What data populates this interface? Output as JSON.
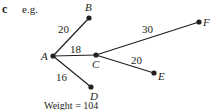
{
  "part_label": "c",
  "intro": "e.g.",
  "graph": {
    "nodes": [
      {
        "id": "A",
        "x": 53,
        "y": 56,
        "label": "A",
        "lx": 41,
        "ly": 60
      },
      {
        "id": "B",
        "x": 89,
        "y": 18,
        "label": "B",
        "lx": 85,
        "ly": 11
      },
      {
        "id": "C",
        "x": 96,
        "y": 55,
        "label": "C",
        "lx": 92,
        "ly": 68
      },
      {
        "id": "D",
        "x": 91,
        "y": 87,
        "label": "D",
        "lx": 90,
        "ly": 100
      },
      {
        "id": "E",
        "x": 154,
        "y": 73,
        "label": "E",
        "lx": 158,
        "ly": 80
      },
      {
        "id": "F",
        "x": 199,
        "y": 22,
        "label": "F",
        "lx": 203,
        "ly": 26
      }
    ],
    "edges": [
      {
        "from": "A",
        "to": "B",
        "weight": "20",
        "wx": 58,
        "wy": 33
      },
      {
        "from": "A",
        "to": "C",
        "weight": "18",
        "wx": 70,
        "wy": 53
      },
      {
        "from": "C",
        "to": "F",
        "weight": "30",
        "wx": 142,
        "wy": 33
      },
      {
        "from": "C",
        "to": "E",
        "weight": "20",
        "wx": 131,
        "wy": 64
      },
      {
        "from": "A",
        "to": "D",
        "weight": "16",
        "wx": 56,
        "wy": 81
      }
    ]
  },
  "footer": "Weight = 104"
}
